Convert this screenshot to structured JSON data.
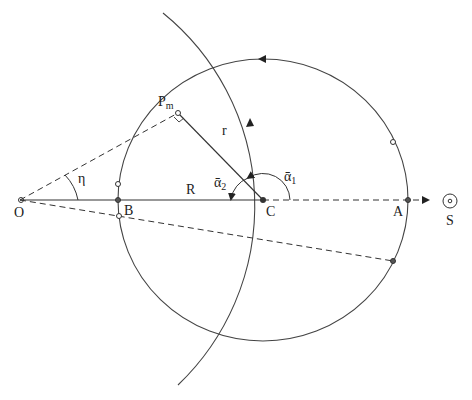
{
  "diagram": {
    "labels": {
      "O": "O",
      "B": "B",
      "C": "C",
      "A": "A",
      "S": "S",
      "R": "R",
      "r": "r",
      "eta": "η",
      "Pm_main": "P",
      "Pm_sub": "m",
      "alpha1_main": "ᾱ",
      "alpha1_sub": "1",
      "alpha2_main": "ᾱ",
      "alpha2_sub": "2"
    },
    "colors": {
      "stroke": "#333333",
      "background": "#ffffff"
    }
  }
}
